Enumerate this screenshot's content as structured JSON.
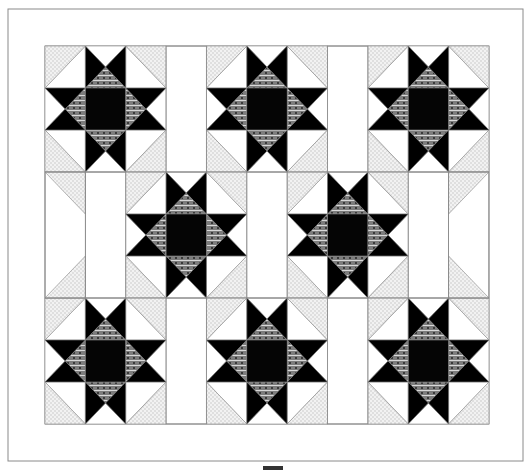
{
  "quilt": {
    "name": "Sawtooth Star Quilt Layout",
    "outer": {
      "x": 8,
      "y": 9,
      "w": 515,
      "h": 452
    },
    "inner": {
      "x": 45,
      "y": 46,
      "cols": 11,
      "rows": 9,
      "unit_w": 40.36,
      "unit_h": 42
    },
    "colors": {
      "background": "#ffffff",
      "line": "#8a8a8a",
      "star_point": "#000000",
      "center": "#050505",
      "diamond": "#7d7d7d",
      "diamond_stripe": "#d8d8d8",
      "dots_base": "#f2f2f2",
      "dots_dot": "#bdbdbd"
    },
    "stars": [
      {
        "col": 0,
        "row": 0
      },
      {
        "col": 4,
        "row": 0
      },
      {
        "col": 8,
        "row": 0
      },
      {
        "col": 2,
        "row": 3
      },
      {
        "col": 6,
        "row": 3
      },
      {
        "col": 0,
        "row": 6
      },
      {
        "col": 4,
        "row": 6
      },
      {
        "col": 8,
        "row": 6
      }
    ],
    "edge_triangles": [
      {
        "col": 0,
        "row": 3,
        "corner": "tl"
      },
      {
        "col": 0,
        "row": 5,
        "corner": "bl"
      },
      {
        "col": 10,
        "row": 3,
        "corner": "tr"
      },
      {
        "col": 10,
        "row": 5,
        "corner": "br"
      }
    ]
  },
  "scroll_indicator": {
    "visible": true
  }
}
